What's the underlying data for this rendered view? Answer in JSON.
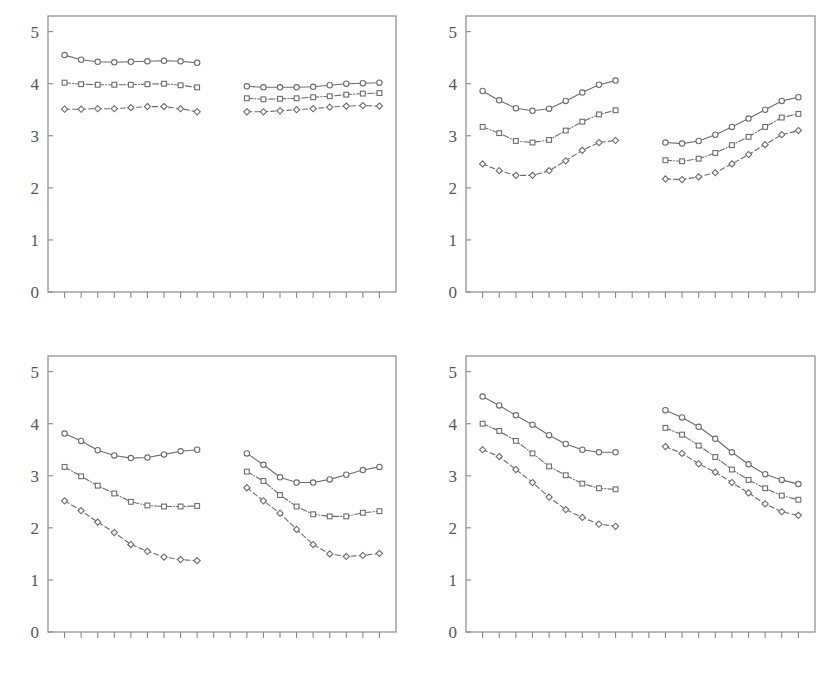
{
  "figure": {
    "background_color": "#ffffff",
    "line_color": "#6d6d6d",
    "axis_color": "#8a8a8a",
    "text_color": "#575757",
    "panel_count": 4
  },
  "chart_data": [
    {
      "id": "panel-top-left",
      "type": "line",
      "title": "",
      "subtitle": "",
      "xlabel": "",
      "ylabel": "",
      "ylim": [
        0,
        5.3
      ],
      "yticks": [
        0,
        1,
        2,
        3,
        4,
        5
      ],
      "ytick_labels": [
        "0",
        "1",
        "2",
        "3",
        "4",
        "5"
      ],
      "xlim": [
        0,
        21
      ],
      "xticks": [
        1,
        2,
        3,
        4,
        5,
        6,
        7,
        8,
        9,
        10,
        11,
        12,
        13,
        14,
        15,
        16,
        17,
        18,
        19,
        20
      ],
      "xtick_labels": [],
      "grid": false,
      "legend": "none",
      "groups": [
        {
          "name": "left-group",
          "x": [
            1,
            2,
            3,
            4,
            5,
            6,
            7,
            8,
            9
          ],
          "series": [
            {
              "name": "series-1",
              "marker": "circle",
              "linestyle": "solid",
              "values": [
                4.55,
                4.46,
                4.42,
                4.41,
                4.42,
                4.43,
                4.44,
                4.43,
                4.4
              ]
            },
            {
              "name": "series-2",
              "marker": "square",
              "linestyle": "dashdot",
              "values": [
                4.02,
                3.99,
                3.98,
                3.98,
                3.98,
                3.99,
                4.0,
                3.97,
                3.93
              ]
            },
            {
              "name": "series-3",
              "marker": "diamond",
              "linestyle": "dashed",
              "values": [
                3.51,
                3.51,
                3.52,
                3.52,
                3.54,
                3.56,
                3.56,
                3.52,
                3.46
              ]
            }
          ]
        },
        {
          "name": "right-group",
          "x": [
            12,
            13,
            14,
            15,
            16,
            17,
            18,
            19,
            20
          ],
          "series": [
            {
              "name": "series-1",
              "marker": "circle",
              "linestyle": "solid",
              "values": [
                3.95,
                3.93,
                3.93,
                3.93,
                3.94,
                3.97,
                4.0,
                4.01,
                4.02
              ]
            },
            {
              "name": "series-2",
              "marker": "square",
              "linestyle": "dashdot",
              "values": [
                3.72,
                3.7,
                3.71,
                3.72,
                3.74,
                3.76,
                3.79,
                3.81,
                3.82
              ]
            },
            {
              "name": "series-3",
              "marker": "diamond",
              "linestyle": "dashed",
              "values": [
                3.46,
                3.46,
                3.48,
                3.5,
                3.52,
                3.55,
                3.57,
                3.58,
                3.57
              ]
            }
          ]
        }
      ]
    },
    {
      "id": "panel-top-right",
      "type": "line",
      "title": "",
      "subtitle": "",
      "xlabel": "",
      "ylabel": "",
      "ylim": [
        0,
        5.3
      ],
      "yticks": [
        0,
        1,
        2,
        3,
        4,
        5
      ],
      "ytick_labels": [
        "0",
        "1",
        "2",
        "3",
        "4",
        "5"
      ],
      "xlim": [
        0,
        21
      ],
      "xticks": [
        1,
        2,
        3,
        4,
        5,
        6,
        7,
        8,
        9,
        10,
        11,
        12,
        13,
        14,
        15,
        16,
        17,
        18,
        19,
        20
      ],
      "xtick_labels": [],
      "grid": false,
      "legend": "none",
      "groups": [
        {
          "name": "left-group",
          "x": [
            1,
            2,
            3,
            4,
            5,
            6,
            7,
            8,
            9
          ],
          "series": [
            {
              "name": "series-1",
              "marker": "circle",
              "linestyle": "solid",
              "values": [
                3.86,
                3.68,
                3.53,
                3.48,
                3.52,
                3.67,
                3.83,
                3.98,
                4.06
              ]
            },
            {
              "name": "series-2",
              "marker": "square",
              "linestyle": "dashdot",
              "values": [
                3.17,
                3.05,
                2.9,
                2.87,
                2.92,
                3.1,
                3.27,
                3.41,
                3.49
              ]
            },
            {
              "name": "series-3",
              "marker": "diamond",
              "linestyle": "dashed",
              "values": [
                2.46,
                2.33,
                2.24,
                2.24,
                2.33,
                2.52,
                2.72,
                2.87,
                2.91
              ]
            }
          ]
        },
        {
          "name": "right-group",
          "x": [
            12,
            13,
            14,
            15,
            16,
            17,
            18,
            19,
            20
          ],
          "series": [
            {
              "name": "series-1",
              "marker": "circle",
              "linestyle": "solid",
              "values": [
                2.87,
                2.85,
                2.9,
                3.02,
                3.17,
                3.33,
                3.5,
                3.67,
                3.74
              ]
            },
            {
              "name": "series-2",
              "marker": "square",
              "linestyle": "dashdot",
              "values": [
                2.53,
                2.51,
                2.56,
                2.67,
                2.82,
                2.98,
                3.17,
                3.35,
                3.42
              ]
            },
            {
              "name": "series-3",
              "marker": "diamond",
              "linestyle": "dashed",
              "values": [
                2.17,
                2.16,
                2.21,
                2.29,
                2.46,
                2.64,
                2.83,
                3.02,
                3.1
              ]
            }
          ]
        }
      ]
    },
    {
      "id": "panel-bottom-left",
      "type": "line",
      "title": "",
      "subtitle": "",
      "xlabel": "",
      "ylabel": "",
      "ylim": [
        0,
        5.3
      ],
      "yticks": [
        0,
        1,
        2,
        3,
        4,
        5
      ],
      "ytick_labels": [
        "0",
        "1",
        "2",
        "3",
        "4",
        "5"
      ],
      "xlim": [
        0,
        21
      ],
      "xticks": [
        1,
        2,
        3,
        4,
        5,
        6,
        7,
        8,
        9,
        10,
        11,
        12,
        13,
        14,
        15,
        16,
        17,
        18,
        19,
        20
      ],
      "xtick_labels": [],
      "grid": false,
      "legend": "none",
      "groups": [
        {
          "name": "left-group",
          "x": [
            1,
            2,
            3,
            4,
            5,
            6,
            7,
            8,
            9
          ],
          "series": [
            {
              "name": "series-1",
              "marker": "circle",
              "linestyle": "solid",
              "values": [
                3.81,
                3.67,
                3.49,
                3.39,
                3.34,
                3.35,
                3.41,
                3.47,
                3.5
              ]
            },
            {
              "name": "series-2",
              "marker": "square",
              "linestyle": "dashdot",
              "values": [
                3.17,
                2.99,
                2.81,
                2.66,
                2.5,
                2.43,
                2.41,
                2.41,
                2.42
              ]
            },
            {
              "name": "series-3",
              "marker": "diamond",
              "linestyle": "dashed",
              "values": [
                2.52,
                2.33,
                2.11,
                1.91,
                1.68,
                1.55,
                1.44,
                1.39,
                1.37
              ]
            }
          ]
        },
        {
          "name": "right-group",
          "x": [
            12,
            13,
            14,
            15,
            16,
            17,
            18,
            19,
            20
          ],
          "series": [
            {
              "name": "series-1",
              "marker": "circle",
              "linestyle": "solid",
              "values": [
                3.43,
                3.21,
                2.97,
                2.87,
                2.87,
                2.93,
                3.02,
                3.11,
                3.17
              ]
            },
            {
              "name": "series-2",
              "marker": "square",
              "linestyle": "dashdot",
              "values": [
                3.08,
                2.9,
                2.63,
                2.41,
                2.26,
                2.22,
                2.22,
                2.29,
                2.32
              ]
            },
            {
              "name": "series-3",
              "marker": "diamond",
              "linestyle": "dashed",
              "values": [
                2.77,
                2.52,
                2.28,
                1.97,
                1.68,
                1.5,
                1.45,
                1.47,
                1.51
              ]
            }
          ]
        }
      ]
    },
    {
      "id": "panel-bottom-right",
      "type": "line",
      "title": "",
      "subtitle": "",
      "xlabel": "",
      "ylabel": "",
      "ylim": [
        0,
        5.3
      ],
      "yticks": [
        0,
        1,
        2,
        3,
        4,
        5
      ],
      "ytick_labels": [
        "0",
        "1",
        "2",
        "3",
        "4",
        "5"
      ],
      "xlim": [
        0,
        21
      ],
      "xticks": [
        1,
        2,
        3,
        4,
        5,
        6,
        7,
        8,
        9,
        10,
        11,
        12,
        13,
        14,
        15,
        16,
        17,
        18,
        19,
        20
      ],
      "xtick_labels": [],
      "grid": false,
      "legend": "none",
      "groups": [
        {
          "name": "left-group",
          "x": [
            1,
            2,
            3,
            4,
            5,
            6,
            7,
            8,
            9
          ],
          "series": [
            {
              "name": "series-1",
              "marker": "circle",
              "linestyle": "solid",
              "values": [
                4.52,
                4.35,
                4.16,
                3.98,
                3.78,
                3.61,
                3.5,
                3.45,
                3.45
              ]
            },
            {
              "name": "series-2",
              "marker": "square",
              "linestyle": "dashdot",
              "values": [
                4.0,
                3.86,
                3.67,
                3.43,
                3.18,
                3.01,
                2.85,
                2.76,
                2.74
              ]
            },
            {
              "name": "series-3",
              "marker": "diamond",
              "linestyle": "dashed",
              "values": [
                3.5,
                3.37,
                3.12,
                2.87,
                2.59,
                2.35,
                2.2,
                2.07,
                2.03
              ]
            }
          ]
        },
        {
          "name": "right-group",
          "x": [
            12,
            13,
            14,
            15,
            16,
            17,
            18,
            19,
            20
          ],
          "series": [
            {
              "name": "series-1",
              "marker": "circle",
              "linestyle": "solid",
              "values": [
                4.26,
                4.12,
                3.94,
                3.71,
                3.45,
                3.22,
                3.03,
                2.92,
                2.84
              ]
            },
            {
              "name": "series-2",
              "marker": "square",
              "linestyle": "dashdot",
              "values": [
                3.92,
                3.79,
                3.58,
                3.36,
                3.12,
                2.92,
                2.76,
                2.62,
                2.54
              ]
            },
            {
              "name": "series-3",
              "marker": "diamond",
              "linestyle": "dashed",
              "values": [
                3.56,
                3.43,
                3.23,
                3.07,
                2.87,
                2.67,
                2.46,
                2.31,
                2.24
              ]
            }
          ]
        }
      ]
    }
  ]
}
